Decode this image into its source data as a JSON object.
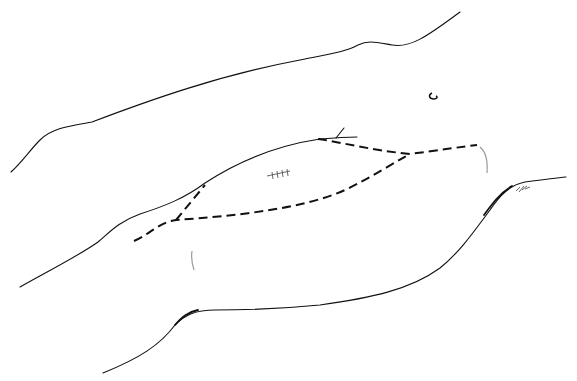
{
  "figure": {
    "type": "surgical-illustration",
    "elements": {
      "upper_outline": "body contour (upper)",
      "middle_outline": "body contour (middle)",
      "lower_outline": "body contour (lower)",
      "incision_main": "dashed incision line (long curved)",
      "incision_upper": "dashed incision line (upper branch)",
      "incision_short": "dashed incision line (short oblique)",
      "scar_mark": "sutured scar mark",
      "umbilicus": "umbilicus mark",
      "hair_marks": "small hair/shading marks"
    },
    "colors": {
      "line": "#111111",
      "scar": "#555555",
      "shading": "#999999",
      "background": "#ffffff"
    }
  }
}
